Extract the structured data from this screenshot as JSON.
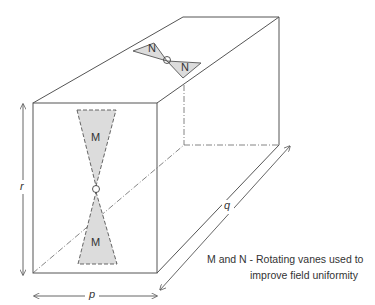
{
  "diagram": {
    "type": "rectangular waveguide / chamber with rotating vanes",
    "labels": {
      "vane_front": "M",
      "vane_top": "N",
      "dim_height": "r",
      "dim_width": "p",
      "dim_length": "q"
    },
    "legend": {
      "line1": "M and N  -  Rotating vanes used to",
      "line2": "improve field uniformity"
    },
    "colors": {
      "stroke": "#555555",
      "vane_fill": "#dcdcdc",
      "text": "#333333"
    }
  }
}
